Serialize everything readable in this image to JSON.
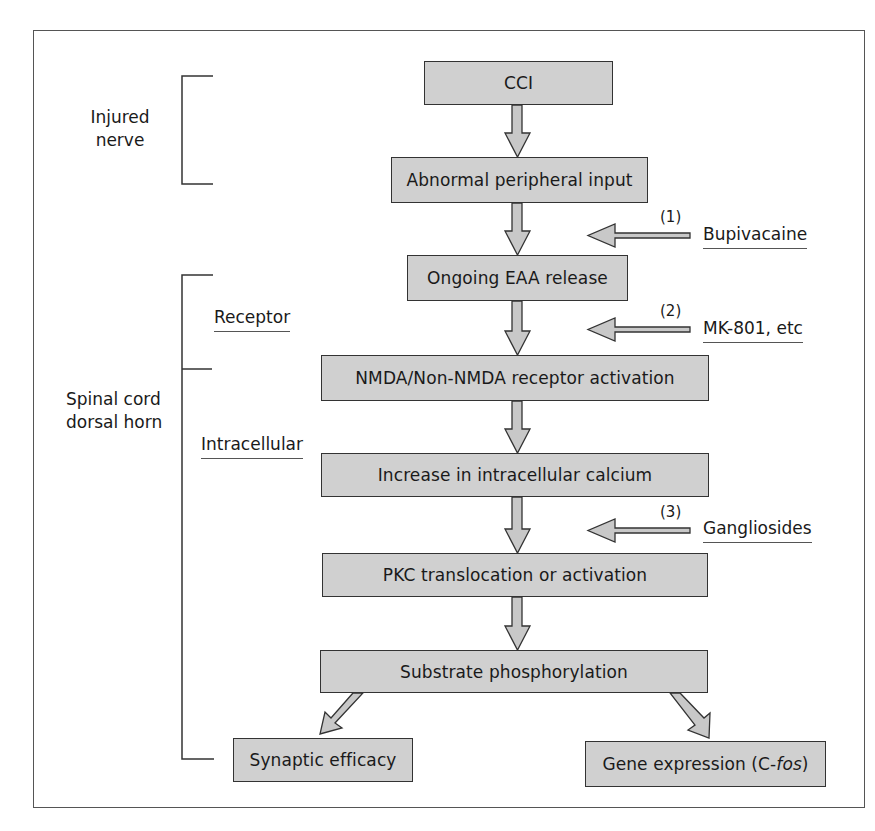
{
  "diagram": {
    "left_labels": {
      "injured_nerve": [
        "Injured",
        "nerve"
      ],
      "spinal_cord": [
        "Spinal cord",
        "dorsal horn"
      ],
      "receptor": "Receptor",
      "intracellular": "Intracellular"
    },
    "nodes": [
      {
        "id": "cci",
        "label": "CCI"
      },
      {
        "id": "abnormal",
        "label": "Abnormal peripheral input"
      },
      {
        "id": "eaa",
        "label": "Ongoing EAA release"
      },
      {
        "id": "nmda",
        "label": "NMDA/Non-NMDA receptor activation"
      },
      {
        "id": "calcium",
        "label": "Increase in intracellular calcium"
      },
      {
        "id": "pkc",
        "label": "PKC translocation or activation"
      },
      {
        "id": "substrate",
        "label": "Substrate phosphorylation"
      },
      {
        "id": "synaptic",
        "label": "Synaptic efficacy"
      },
      {
        "id": "gene",
        "label": "Gene expression (C-",
        "label_italic": "fos",
        "label_suffix": ")"
      }
    ],
    "inhibitors": [
      {
        "number": "(1)",
        "label": "Bupivacaine",
        "target": "between abnormal and eaa"
      },
      {
        "number": "(2)",
        "label": "MK-801, etc",
        "target": "between eaa and nmda"
      },
      {
        "number": "(3)",
        "label": "Gangliosides",
        "target": "between calcium and pkc"
      }
    ],
    "edges": [
      [
        "cci",
        "abnormal"
      ],
      [
        "abnormal",
        "eaa"
      ],
      [
        "eaa",
        "nmda"
      ],
      [
        "nmda",
        "calcium"
      ],
      [
        "calcium",
        "pkc"
      ],
      [
        "pkc",
        "substrate"
      ],
      [
        "substrate",
        "synaptic"
      ],
      [
        "substrate",
        "gene"
      ]
    ],
    "colors": {
      "box_fill": "#d0d0d0",
      "arrow_fill": "#c8c8c8",
      "stroke": "#333333"
    }
  }
}
